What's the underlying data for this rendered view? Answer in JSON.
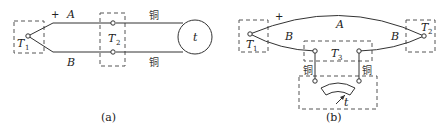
{
  "diagram_a": {
    "caption": "(a)",
    "wire_top_label": "A",
    "wire_bottom_label": "B",
    "polarity": "+",
    "hot_junction": {
      "label": "T",
      "subscript": "1"
    },
    "reference_junction": {
      "label": "T",
      "subscript": "2"
    },
    "copper_top": "铜",
    "copper_bottom": "铜",
    "instrument_label": "t"
  },
  "diagram_b": {
    "caption": "(b)",
    "wire_arc_label": "A",
    "wire_left_label": "B",
    "wire_right_label": "B",
    "polarity": "+",
    "junction_left": {
      "label": "T",
      "subscript": "1"
    },
    "junction_right": {
      "label": "T",
      "subscript": "2"
    },
    "junction_middle": {
      "label": "T",
      "subscript": "3"
    },
    "copper_left": "铜",
    "copper_right": "铜",
    "meter_label": "t"
  }
}
